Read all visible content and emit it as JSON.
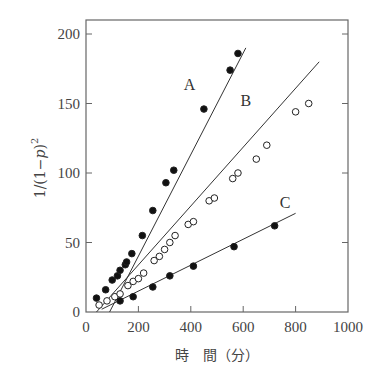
{
  "chart_data": {
    "type": "scatter",
    "title": "",
    "xlabel": "時　間（分）",
    "ylabel": "1/(1−p)²",
    "xlim": [
      0,
      1000
    ],
    "ylim": [
      0,
      200
    ],
    "xticks": [
      0,
      200,
      400,
      600,
      800,
      1000
    ],
    "yticks": [
      0,
      50,
      100,
      150,
      200
    ],
    "grid": false,
    "legend": "none (series labeled inline A, B, C)",
    "series": [
      {
        "name": "A",
        "marker": "filled-circle",
        "fit_line": {
          "x": [
            90,
            610
          ],
          "y": [
            0,
            190
          ]
        },
        "x": [
          40,
          75,
          100,
          120,
          130,
          150,
          155,
          175,
          215,
          255,
          305,
          335,
          450,
          550,
          580
        ],
        "y": [
          10,
          16,
          23,
          26,
          30,
          34,
          36,
          42,
          55,
          73,
          93,
          102,
          146,
          174,
          186
        ],
        "label_pos": [
          395,
          160
        ]
      },
      {
        "name": "B",
        "marker": "open-circle",
        "fit_line": {
          "x": [
            40,
            890
          ],
          "y": [
            0,
            180
          ]
        },
        "x": [
          50,
          80,
          110,
          130,
          160,
          180,
          200,
          220,
          260,
          280,
          300,
          320,
          340,
          390,
          410,
          470,
          490,
          560,
          580,
          650,
          690,
          800,
          850
        ],
        "y": [
          5,
          8,
          11,
          13,
          19,
          22,
          24,
          28,
          37,
          40,
          45,
          50,
          55,
          63,
          65,
          80,
          82,
          96,
          100,
          110,
          120,
          144,
          150
        ],
        "label_pos": [
          610,
          148
        ]
      },
      {
        "name": "C",
        "marker": "filled-circle",
        "fit_line": {
          "x": [
            60,
            800
          ],
          "y": [
            2,
            71
          ]
        },
        "x": [
          130,
          180,
          255,
          320,
          410,
          565,
          720
        ],
        "y": [
          8,
          11,
          18,
          26,
          33,
          47,
          62
        ],
        "label_pos": [
          760,
          75
        ]
      }
    ]
  },
  "axes": {
    "x_tick_labels": [
      "0",
      "200",
      "400",
      "600",
      "800",
      "1000"
    ],
    "y_tick_labels": [
      "0",
      "50",
      "100",
      "150",
      "200"
    ],
    "x_title": "時　間（分）",
    "y_title": "1/(1−p)²"
  }
}
